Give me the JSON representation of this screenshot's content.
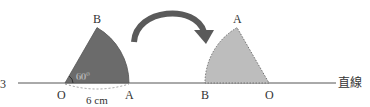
{
  "diagram": {
    "line_label": "直線",
    "margin_mark": "3",
    "left_sector": {
      "center_label": "O",
      "point_a_label": "A",
      "point_b_label": "B",
      "angle_label": "60°",
      "radius_label": "6 cm",
      "fill": "#6b6b6b"
    },
    "right_sector": {
      "center_label": "O",
      "point_a_label": "A",
      "point_b_label": "B",
      "fill": "#bdbdbd"
    },
    "arrow": {
      "color": "#5a5a5a"
    }
  }
}
